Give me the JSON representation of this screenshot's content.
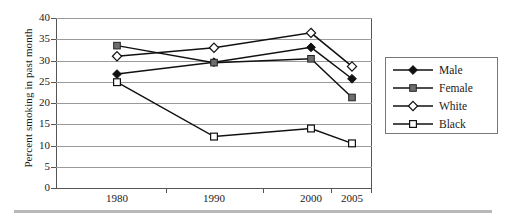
{
  "chart_data": {
    "type": "line",
    "title": "",
    "xlabel": "",
    "ylabel": "Percent smoking in past month",
    "categories": [
      "1980",
      "1990",
      "2000",
      "2005"
    ],
    "ylim": [
      0,
      40
    ],
    "ytick_step": 5,
    "yticks": [
      "40",
      "35",
      "30",
      "25",
      "20",
      "15",
      "10",
      "5",
      "0"
    ],
    "grid": true,
    "legend_position": "right",
    "series": [
      {
        "name": "Male",
        "marker": "filled-diamond",
        "color": "#111111",
        "values": [
          26.8,
          29.6,
          33.1,
          25.7
        ]
      },
      {
        "name": "Female",
        "marker": "filled-square",
        "color": "#6e6e6e",
        "values": [
          33.5,
          29.5,
          30.4,
          21.3
        ]
      },
      {
        "name": "White",
        "marker": "open-diamond",
        "color": "#ffffff",
        "values": [
          31.0,
          33.0,
          36.5,
          28.6
        ]
      },
      {
        "name": "Black",
        "marker": "open-square",
        "color": "#ffffff",
        "values": [
          24.9,
          12.1,
          14.0,
          10.5
        ]
      }
    ]
  },
  "legend": {
    "entries": [
      {
        "label": "Male",
        "marker": "filled-diamond-icon"
      },
      {
        "label": "Female",
        "marker": "filled-square-icon"
      },
      {
        "label": "White",
        "marker": "open-diamond-icon"
      },
      {
        "label": "Black",
        "marker": "open-square-icon"
      }
    ]
  }
}
